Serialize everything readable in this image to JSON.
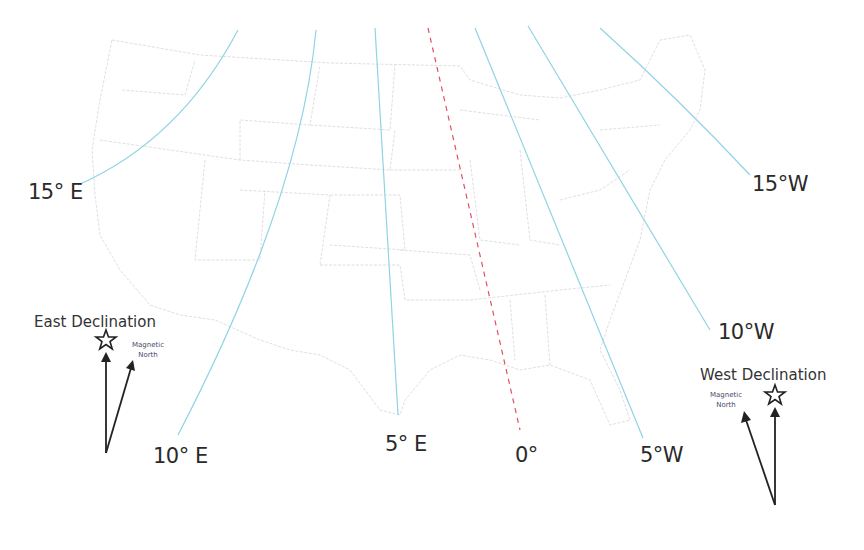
{
  "map": {
    "subject": "Magnetic declination isogonic lines over the contiguous United States",
    "isogonic_lines": [
      {
        "label": "15° E",
        "value": 15,
        "direction": "E"
      },
      {
        "label": "10° E",
        "value": 10,
        "direction": "E"
      },
      {
        "label": "5° E",
        "value": 5,
        "direction": "E"
      },
      {
        "label": "0°",
        "value": 0,
        "direction": "agonic"
      },
      {
        "label": "5°W",
        "value": 5,
        "direction": "W"
      },
      {
        "label": "10°W",
        "value": 10,
        "direction": "W"
      },
      {
        "label": "15°W",
        "value": 15,
        "direction": "W"
      }
    ],
    "colors": {
      "isogonic_line": "#8fd4e4",
      "agonic_line": "#e05060",
      "state_borders": "#d0d0d8",
      "text": "#2a2a2a"
    }
  },
  "legend_east": {
    "title": "East Declination",
    "magnetic_label_1": "Magnetic",
    "magnetic_label_2": "North",
    "true_north_icon": "star-icon"
  },
  "legend_west": {
    "title": "West Declination",
    "magnetic_label_1": "Magnetic",
    "magnetic_label_2": "North",
    "true_north_icon": "star-icon"
  }
}
